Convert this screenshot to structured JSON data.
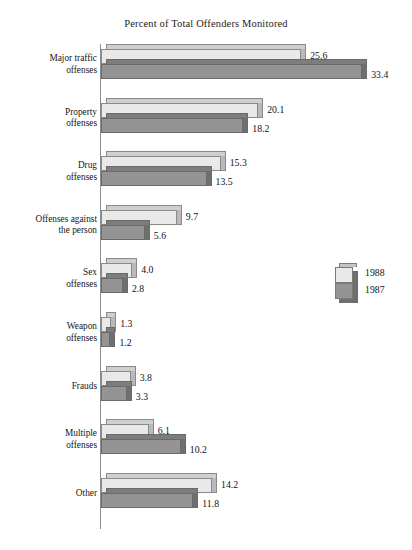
{
  "chart_data": {
    "type": "bar",
    "orientation": "horizontal",
    "title": "Percent of Total Offenders Monitored",
    "xlabel": "",
    "ylabel": "",
    "xlim": [
      0,
      33.4
    ],
    "grid": false,
    "legend_position": "right",
    "categories": [
      "Major traffic offenses",
      "Property offenses",
      "Drug offenses",
      "Offenses against the person",
      "Sex offenses",
      "Weapon offenses",
      "Frauds",
      "Multiple offenses",
      "Other"
    ],
    "series": [
      {
        "name": "1988",
        "color": "#e9e9e9",
        "values": [
          25.6,
          20.1,
          15.3,
          9.7,
          4.0,
          1.3,
          3.8,
          6.1,
          14.2
        ]
      },
      {
        "name": "1987",
        "color": "#949494",
        "values": [
          33.4,
          18.2,
          13.5,
          5.6,
          2.8,
          1.2,
          3.3,
          10.2,
          11.8
        ]
      }
    ]
  },
  "categories": [
    {
      "line1": "Major traffic",
      "line2": "offenses"
    },
    {
      "line1": "Property",
      "line2": "offenses"
    },
    {
      "line1": "Drug",
      "line2": "offenses"
    },
    {
      "line1": "Offenses against",
      "line2": "the person"
    },
    {
      "line1": "Sex",
      "line2": "offenses"
    },
    {
      "line1": "Weapon",
      "line2": "offenses"
    },
    {
      "line1": "Frauds",
      "line2": ""
    },
    {
      "line1": "Multiple",
      "line2": "offenses"
    },
    {
      "line1": "Other",
      "line2": ""
    }
  ],
  "value_labels_1988": [
    "25.6",
    "20.1",
    "15.3",
    "9.7",
    "4.0",
    "1.3",
    "3.8",
    "6.1",
    "14.2"
  ],
  "value_labels_1987": [
    "33.4",
    "18.2",
    "13.5",
    "5.6",
    "2.8",
    "1.2",
    "3.3",
    "10.2",
    "11.8"
  ],
  "legend": {
    "series_1_label": "1988",
    "series_2_label": "1987"
  },
  "colors": {
    "series_1988": "#e9e9e9",
    "series_1987": "#949494",
    "axis": "#8d8d8d",
    "text": "#141414",
    "background": "#ffffff"
  }
}
